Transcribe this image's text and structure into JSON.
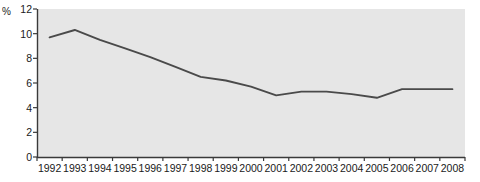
{
  "chart_data": {
    "type": "line",
    "title": "",
    "subtitle": "",
    "xlabel": "",
    "ylabel": "%",
    "unit_label": "%",
    "categories": [
      "1992",
      "1993",
      "1994",
      "1995",
      "1996",
      "1997",
      "1998",
      "1999",
      "2000",
      "2001",
      "2002",
      "2003",
      "2004",
      "2005",
      "2006",
      "2007",
      "2008"
    ],
    "x": [
      1992,
      1993,
      1994,
      1995,
      1996,
      1997,
      1998,
      1999,
      2000,
      2001,
      2002,
      2003,
      2004,
      2005,
      2006,
      2007,
      2008
    ],
    "values": [
      9.7,
      10.3,
      9.5,
      8.8,
      8.1,
      7.3,
      6.5,
      6.2,
      5.7,
      5.0,
      5.3,
      5.3,
      5.1,
      4.8,
      5.5,
      5.5,
      5.5
    ],
    "series": [
      {
        "name": "",
        "values": [
          9.7,
          10.3,
          9.5,
          8.8,
          8.1,
          7.3,
          6.5,
          6.2,
          5.7,
          5.0,
          5.3,
          5.3,
          5.1,
          4.8,
          5.5,
          5.5,
          5.5
        ]
      }
    ],
    "ylim": [
      0,
      12
    ],
    "yticks": [
      0,
      2,
      4,
      6,
      8,
      10,
      12
    ],
    "ytick_labels": [
      "0",
      "2",
      "4",
      "6",
      "8",
      "10",
      "12"
    ],
    "grid": false,
    "legend": false,
    "legend_position": "none",
    "annotations": [],
    "colors": {
      "line": "#4a4a4a",
      "plot_background": "#e6e6e6",
      "axis": "#3a3a3a",
      "text": "#1a1a1a",
      "page_background": "#ffffff"
    },
    "plot_area": {
      "left": 37,
      "right": 465,
      "top": 9,
      "bottom": 157
    }
  }
}
